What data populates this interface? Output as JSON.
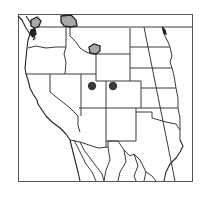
{
  "map": {
    "region": "Western North America",
    "colors": {
      "range_fill": "#a8a8a8",
      "range_stroke": "#222222",
      "occurrence_dot": "#3a3a3a",
      "border": "#3a3a3a",
      "background": "#ffffff"
    },
    "range_patches": [
      {
        "name": "washington-olympic-cascade",
        "approx": "NW Washington"
      },
      {
        "name": "northern-idaho-montana-border",
        "approx": "N Idaho / NW Montana"
      },
      {
        "name": "southwest-montana",
        "approx": "SW Montana"
      },
      {
        "name": "northeast-minnesota",
        "approx": "NE edge"
      }
    ],
    "occurrence_points": [
      {
        "name": "utah-point",
        "approx": "E Utah"
      },
      {
        "name": "colorado-point",
        "approx": "W Colorado"
      }
    ]
  }
}
